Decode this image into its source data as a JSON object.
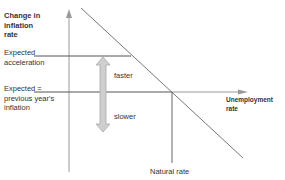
{
  "diagram": {
    "y_axis_label": [
      "Change in",
      "inflation",
      "rate"
    ],
    "x_axis_label": [
      "Unemployment",
      "rate"
    ],
    "level_labels": {
      "expected_acceleration": [
        "Expected",
        "acceleration"
      ],
      "expected_previous": [
        "Expected =",
        "previous year's",
        "inflation"
      ]
    },
    "arrow_labels": {
      "up": "faster",
      "down": "slower"
    },
    "natural_rate_label": "Natural rate",
    "colors": {
      "axis": "#9a9a9a",
      "line": "#555555",
      "double_arrow_fill": "#cfcfcf",
      "double_arrow_stroke": "#a8a8a8"
    }
  }
}
